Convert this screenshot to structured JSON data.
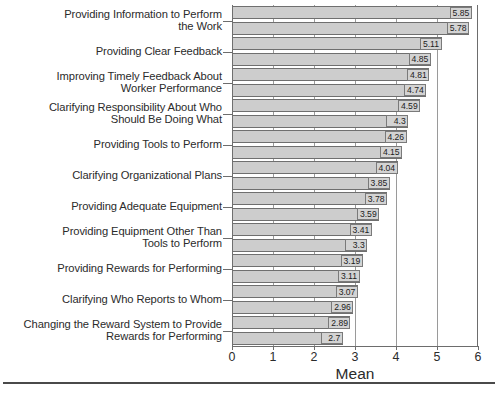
{
  "chart_data": {
    "type": "bar",
    "orientation": "horizontal",
    "title": "",
    "xlabel": "Mean",
    "ylabel": "",
    "xlim": [
      0,
      6
    ],
    "xticks": [
      0,
      1,
      2,
      3,
      4,
      5,
      6
    ],
    "xtick_labels": [
      "0",
      "1",
      "2",
      "3",
      "4",
      "5",
      "6"
    ],
    "grid": true,
    "grid_axis": "x",
    "legend": null,
    "bar_fill_color": "#cdcdcd",
    "bar_edge_color": "#6f6f6f",
    "categories": [
      "Providing Information to Perform\nthe Work",
      "",
      "Providing Clear Feedback",
      "",
      "Improving Timely Feedback About\nWorker Performance",
      "",
      "Clarifying Responsibility About Who\nShould Be Doing What",
      "",
      "Providing Tools to Perform",
      "",
      "Clarifying Organizational Plans",
      "",
      "Providing Adequate Equipment",
      "",
      "Providing Equipment Other Than\nTools to Perform",
      "",
      "Providing Rewards for Performing",
      "",
      "Clarifying Who Reports to Whom",
      "",
      "Changing the Reward System to Provide\nRewards for Performing",
      ""
    ],
    "values": [
      5.85,
      5.78,
      5.11,
      4.85,
      4.81,
      4.74,
      4.59,
      4.3,
      4.26,
      4.15,
      4.04,
      3.85,
      3.78,
      3.59,
      3.41,
      3.3,
      3.19,
      3.11,
      3.07,
      2.96,
      2.89,
      2.7
    ],
    "value_labels": [
      "5.85",
      "5.78",
      "5.11",
      "4.85",
      "4.81",
      "4.74",
      "4.59",
      "4.3",
      "4.26",
      "4.15",
      "4.04",
      "3.85",
      "3.78",
      "3.59",
      "3.41",
      "3.3",
      "3.19",
      "3.11",
      "3.07",
      "2.96",
      "2.89",
      "2.7"
    ]
  }
}
